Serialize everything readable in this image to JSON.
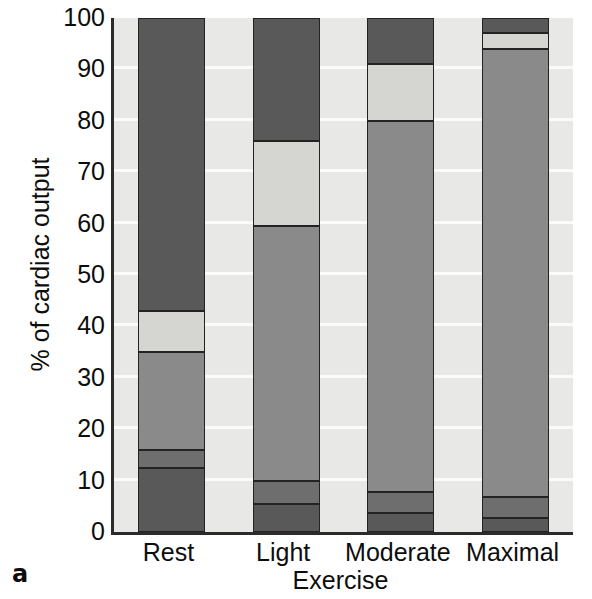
{
  "figure": {
    "panel_letter": "a"
  },
  "chart_data": {
    "type": "bar",
    "stacked": true,
    "title": "",
    "xlabel": "Exercise",
    "ylabel": "% of cardiac output",
    "ylim": [
      0,
      100
    ],
    "ytick_labels": [
      "100",
      "90",
      "80",
      "70",
      "60",
      "50",
      "40",
      "30",
      "20",
      "10",
      "0"
    ],
    "ytick_values": [
      100,
      90,
      80,
      70,
      60,
      50,
      40,
      30,
      20,
      10,
      0
    ],
    "grid": true,
    "grid_axis": "y",
    "legend": "none",
    "categories": [
      "Rest",
      "Light",
      "Moderate",
      "Maximal"
    ],
    "series": [
      {
        "name": "segment-1-bottom",
        "color": "#595959",
        "values": [
          12.5,
          5.5,
          3.7,
          2.7
        ]
      },
      {
        "name": "segment-2",
        "color": "#6e6e6e",
        "values": [
          3.5,
          4.5,
          4.1,
          4.1
        ]
      },
      {
        "name": "segment-3-middle",
        "color": "#8a8a8a",
        "values": [
          19.0,
          49.5,
          72.2,
          87.2
        ]
      },
      {
        "name": "segment-4-light",
        "color": "#d5d5d2",
        "values": [
          8.0,
          16.5,
          11.0,
          3.0
        ]
      },
      {
        "name": "segment-5-top",
        "color": "#595959",
        "values": [
          57.0,
          24.0,
          9.0,
          3.0
        ]
      }
    ],
    "cumulative_boundaries": {
      "Rest": [
        0,
        12.5,
        16.0,
        35.0,
        43.0,
        100
      ],
      "Light": [
        0,
        5.5,
        10.0,
        59.5,
        76.0,
        100
      ],
      "Moderate": [
        0,
        3.7,
        7.8,
        80.0,
        91.0,
        100
      ],
      "Maximal": [
        0,
        2.7,
        6.8,
        94.0,
        97.0,
        100
      ]
    },
    "colors": {
      "plot_background": "#e8e8e6",
      "gridline": "#fbfbfa",
      "axis": "#2b2b2b",
      "segment_border": "#232323"
    }
  }
}
